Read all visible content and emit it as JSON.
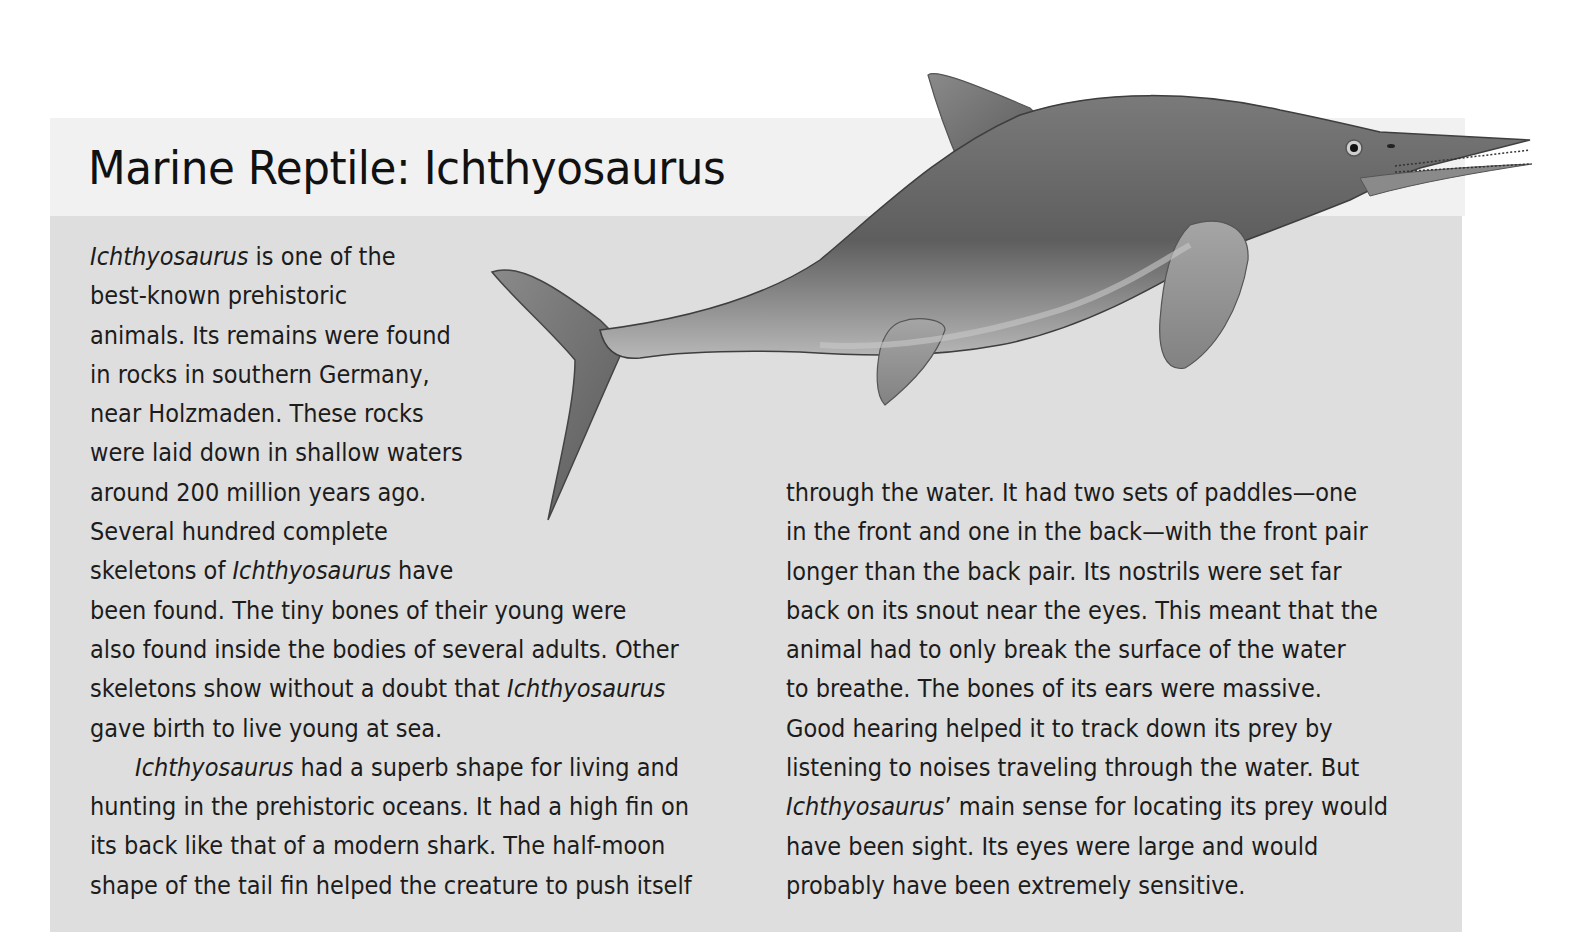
{
  "page": {
    "title": "Marine Reptile: Ichthyosaurus",
    "colors": {
      "page_background": "#ffffff",
      "header_band": "#f1f1f1",
      "body_panel": "#dedede",
      "text": "#1c1c1c",
      "creature_body": "#6e6e6e",
      "creature_belly": "#b5b5b5"
    }
  },
  "illustration": {
    "subject": "Ichthyosaurus",
    "description": "Grayscale painted illustration of an ichthyosaurus swimming to the right, with crescent tail fin, dorsal fin, front and rear paddles and a long toothed snout"
  },
  "left_column": {
    "lines": [
      [
        {
          "t": "Ichthyosaurus",
          "i": true
        },
        {
          "t": " is one of the"
        }
      ],
      [
        {
          "t": "best-known prehistoric"
        }
      ],
      [
        {
          "t": "animals. Its remains were found"
        }
      ],
      [
        {
          "t": "in rocks in southern Germany,"
        }
      ],
      [
        {
          "t": "near Holzmaden. These rocks"
        }
      ],
      [
        {
          "t": "were laid down in shallow waters"
        }
      ],
      [
        {
          "t": "around 200 million years ago."
        }
      ],
      [
        {
          "t": "Several hundred complete"
        }
      ],
      [
        {
          "t": "skeletons of "
        },
        {
          "t": "Ichthyosaurus",
          "i": true
        },
        {
          "t": " have"
        }
      ],
      [
        {
          "t": "been found. The tiny bones of their young were"
        }
      ],
      [
        {
          "t": "also found inside the bodies of several adults. Other"
        }
      ],
      [
        {
          "t": "skeletons show without a doubt that "
        },
        {
          "t": "Ichthyosaurus",
          "i": true
        }
      ],
      [
        {
          "t": "gave birth to live young at sea."
        }
      ],
      [
        {
          "t": "Ichthyosaurus",
          "i": true
        },
        {
          "t": " had a superb shape for living and"
        }
      ],
      [
        {
          "t": "hunting in the prehistoric oceans. It had a high fin on"
        }
      ],
      [
        {
          "t": "its back like that of a modern shark. The half-moon"
        }
      ],
      [
        {
          "t": "shape of the tail fin helped the creature to push itself"
        }
      ]
    ],
    "indented_line_index": 13
  },
  "right_column": {
    "lines": [
      [
        {
          "t": "through the water. It had two sets of paddles—one"
        }
      ],
      [
        {
          "t": "in the front and one in the back—with the front pair"
        }
      ],
      [
        {
          "t": "longer than the back pair. Its nostrils were set far"
        }
      ],
      [
        {
          "t": "back on its snout near the eyes. This meant that the"
        }
      ],
      [
        {
          "t": "animal had to only break the surface of the water"
        }
      ],
      [
        {
          "t": "to breathe. The bones of its ears were massive."
        }
      ],
      [
        {
          "t": "Good hearing helped it to track down its prey by"
        }
      ],
      [
        {
          "t": "listening to noises traveling through the water. But"
        }
      ],
      [
        {
          "t": "Ichthyosaurus",
          "i": true
        },
        {
          "t": "’ main sense for locating its prey would"
        }
      ],
      [
        {
          "t": "have been sight. Its eyes were large and would"
        }
      ],
      [
        {
          "t": "probably have been extremely sensitive."
        }
      ]
    ]
  }
}
